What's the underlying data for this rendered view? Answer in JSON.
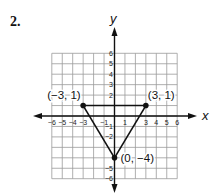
{
  "problem": {
    "number": "2."
  },
  "chart_data": {
    "type": "scatter",
    "title": "",
    "xlabel": "x",
    "ylabel": "y",
    "xlim": [
      -6,
      6
    ],
    "ylim": [
      -6,
      6
    ],
    "grid": true,
    "x_ticks": [
      "−6",
      "−5",
      "−4",
      "−3",
      "−1",
      "1",
      "3",
      "4",
      "5",
      "6"
    ],
    "y_ticks": [
      "6",
      "5",
      "4",
      "3",
      "2",
      "−1",
      "−2",
      "−5",
      "−6"
    ],
    "shape": "triangle",
    "points": [
      {
        "x": -3,
        "y": 1,
        "label": "(−3, 1)"
      },
      {
        "x": 3,
        "y": 1,
        "label": "(3, 1)"
      },
      {
        "x": 0,
        "y": -4,
        "label": "(0, −4)"
      }
    ],
    "edges": [
      [
        0,
        1
      ],
      [
        1,
        2
      ],
      [
        2,
        0
      ]
    ]
  },
  "colors": {
    "grid": "#9a9a9a",
    "axis": "#111111",
    "shape": "#111111"
  }
}
